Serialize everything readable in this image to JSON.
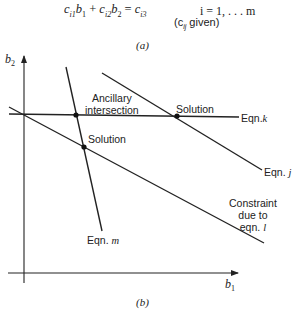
{
  "part_a": {
    "equation_lhs_1": "c",
    "equation_sub_1": "i1",
    "equation_var_1": "b",
    "equation_vsub_1": "1",
    "equation_plus": " + ",
    "equation_lhs_2": "c",
    "equation_sub_2": "i2",
    "equation_var_2": "b",
    "equation_vsub_2": "2",
    "equation_equals": " = ",
    "equation_rhs": "c",
    "equation_rhs_sub": "i3",
    "index_range": "i = 1, . . . m",
    "given_open": "(c",
    "given_sub": "ij",
    "given_close": " given)",
    "caption": "(a)"
  },
  "part_b": {
    "caption": "(b)",
    "axes": {
      "y_label": "b",
      "y_sub": "2",
      "x_label": "b",
      "x_sub": "1"
    },
    "labels": {
      "ancillary_line1": "Ancillary",
      "ancillary_line2": "intersection",
      "solution_left": "Solution",
      "solution_right": "Solution",
      "eqn_k": "Eqn.",
      "eqn_k_var": "k",
      "eqn_j": "Eqn.",
      "eqn_j_var": "j",
      "eqn_m": "Eqn.",
      "eqn_m_var": "m",
      "constraint_line1": "Constraint",
      "constraint_line2": "due to",
      "constraint_line3": "eqn.",
      "constraint_var": "l"
    },
    "lines": [
      {
        "name": "eqn-k",
        "x1": 9,
        "y1": 114,
        "x2": 239,
        "y2": 117
      },
      {
        "name": "eqn-j",
        "x1": 102,
        "y1": 73,
        "x2": 262,
        "y2": 170
      },
      {
        "name": "eqn-l",
        "x1": 9,
        "y1": 107,
        "x2": 264,
        "y2": 243
      },
      {
        "name": "eqn-m",
        "x1": 66,
        "y1": 67,
        "x2": 102,
        "y2": 231
      }
    ],
    "points": [
      {
        "name": "ancillary-intersection",
        "x": 76,
        "y": 115
      },
      {
        "name": "solution-left",
        "x": 84,
        "y": 147
      },
      {
        "name": "solution-right",
        "x": 177,
        "y": 116
      }
    ],
    "colors": {
      "ink": "#222222",
      "background": "#ffffff"
    }
  }
}
